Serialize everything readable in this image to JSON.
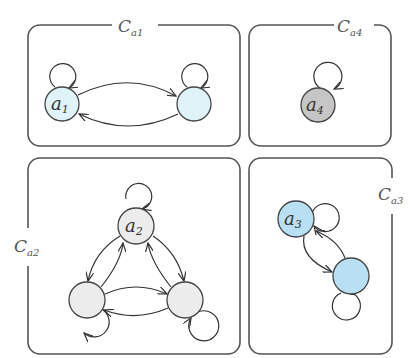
{
  "diagram": {
    "colors": {
      "class_a1": "#dff3f8",
      "class_a2": "#ececec",
      "class_a3": "#b9dff3",
      "class_a4": "#c6c6c6",
      "stroke": "#444444",
      "box": "#555555"
    },
    "classes": [
      {
        "id": "Ca1",
        "label": "C",
        "sub": "a1",
        "nodes": [
          {
            "label": "a",
            "sub": "1"
          },
          {
            "label": ""
          }
        ]
      },
      {
        "id": "Ca4",
        "label": "C",
        "sub": "a4",
        "nodes": [
          {
            "label": "a",
            "sub": "4"
          }
        ]
      },
      {
        "id": "Ca2",
        "label": "C",
        "sub": "a2",
        "nodes": [
          {
            "label": "a",
            "sub": "2"
          },
          {
            "label": ""
          },
          {
            "label": ""
          }
        ]
      },
      {
        "id": "Ca3",
        "label": "C",
        "sub": "a3",
        "nodes": [
          {
            "label": "a",
            "sub": "3"
          },
          {
            "label": ""
          }
        ]
      }
    ]
  }
}
